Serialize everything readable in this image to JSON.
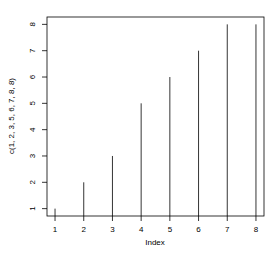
{
  "chart_data": {
    "type": "bar",
    "subtype": "r-type-h-vertical-lines",
    "title": "",
    "xlabel": "Index",
    "ylabel": "c(1, 2, 3, 5, 6, 7, 8, 8)",
    "x": [
      1,
      2,
      3,
      4,
      5,
      6,
      7,
      8
    ],
    "values": [
      1,
      2,
      3,
      5,
      6,
      7,
      8,
      8
    ],
    "xticks": [
      "1",
      "2",
      "3",
      "4",
      "5",
      "6",
      "7",
      "8"
    ],
    "yticks": [
      "1",
      "2",
      "3",
      "4",
      "5",
      "6",
      "7",
      "8"
    ],
    "xlim": [
      0.72,
      8.28
    ],
    "ylim": [
      0.72,
      8.28
    ],
    "grid": false,
    "legend": null
  },
  "colors": {
    "line": "#000000",
    "axis": "#000000",
    "background": "#ffffff"
  }
}
